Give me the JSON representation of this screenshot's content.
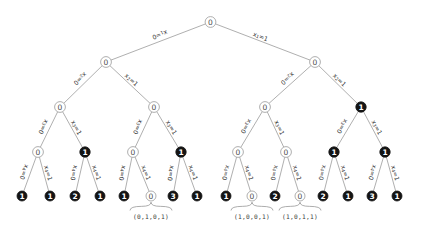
{
  "diagram": {
    "type": "binary-decision-tree",
    "depth": 4,
    "colors": {
      "edge": "#8c8c8c",
      "node_open_fill": "#ffffff",
      "node_open_stroke": "#9a9a9a",
      "node_filled_fill": "#141414",
      "node_open_text": "#4a4a4a",
      "node_filled_text": "#ffffff",
      "label_text": "#2e2e2e",
      "background": "#ffffff"
    },
    "edge_labels": {
      "level1_left": {
        "var": "x",
        "sub": "1",
        "eq": "=0"
      },
      "level1_right": {
        "var": "x",
        "sub": "1",
        "eq": "=1"
      },
      "level2_left": {
        "var": "x",
        "sub": "2",
        "eq": "=0"
      },
      "level2_right": {
        "var": "x",
        "sub": "2",
        "eq": "=1"
      },
      "level3_left": {
        "var": "x",
        "sub": "3",
        "eq": "=0"
      },
      "level3_right": {
        "var": "x",
        "sub": "3",
        "eq": "=1"
      },
      "level4_left": {
        "var": "x",
        "sub": "4",
        "eq": "=0"
      },
      "level4_right": {
        "var": "x",
        "sub": "4",
        "eq": "=1"
      }
    },
    "levels": [
      {
        "level": 0,
        "name": "root",
        "nodes": [
          {
            "id": "n0",
            "label": "0",
            "style": "open",
            "x": 210.5,
            "y": 22
          }
        ]
      },
      {
        "level": 1,
        "name": "level-1",
        "nodes": [
          {
            "id": "n00",
            "label": "0",
            "style": "open",
            "x": 106,
            "y": 62
          },
          {
            "id": "n01",
            "label": "0",
            "style": "open",
            "x": 315,
            "y": 62
          }
        ]
      },
      {
        "level": 2,
        "name": "level-2",
        "nodes": [
          {
            "id": "n000",
            "label": "0",
            "style": "open",
            "x": 60,
            "y": 107
          },
          {
            "id": "n001",
            "label": "0",
            "style": "open",
            "x": 154,
            "y": 107
          },
          {
            "id": "n010",
            "label": "0",
            "style": "open",
            "x": 265,
            "y": 107
          },
          {
            "id": "n011",
            "label": "1",
            "style": "filled",
            "x": 361,
            "y": 107
          }
        ]
      },
      {
        "level": 3,
        "name": "level-3",
        "nodes": [
          {
            "id": "n0000",
            "label": "0",
            "style": "open",
            "x": 38,
            "y": 152
          },
          {
            "id": "n0001",
            "label": "1",
            "style": "filled",
            "x": 85,
            "y": 152
          },
          {
            "id": "n0010",
            "label": "0",
            "style": "open",
            "x": 133,
            "y": 152
          },
          {
            "id": "n0011",
            "label": "1",
            "style": "filled",
            "x": 181,
            "y": 152
          },
          {
            "id": "n0100",
            "label": "0",
            "style": "open",
            "x": 238,
            "y": 152
          },
          {
            "id": "n0101",
            "label": "0",
            "style": "open",
            "x": 286,
            "y": 152
          },
          {
            "id": "n0110",
            "label": "1",
            "style": "filled",
            "x": 334,
            "y": 152
          },
          {
            "id": "n0111",
            "label": "1",
            "style": "filled",
            "x": 385,
            "y": 152
          }
        ]
      },
      {
        "level": 4,
        "name": "leaves",
        "nodes": [
          {
            "id": "l0",
            "label": "1",
            "style": "filled",
            "x": 22,
            "y": 196
          },
          {
            "id": "l1",
            "label": "1",
            "style": "filled",
            "x": 50,
            "y": 196
          },
          {
            "id": "l2",
            "label": "2",
            "style": "filled",
            "x": 75,
            "y": 196
          },
          {
            "id": "l3",
            "label": "1",
            "style": "filled",
            "x": 100,
            "y": 196
          },
          {
            "id": "l4",
            "label": "1",
            "style": "filled",
            "x": 124,
            "y": 196
          },
          {
            "id": "l5",
            "label": "0",
            "style": "open",
            "x": 151,
            "y": 196
          },
          {
            "id": "l6",
            "label": "3",
            "style": "filled",
            "x": 173,
            "y": 196
          },
          {
            "id": "l7",
            "label": "1",
            "style": "filled",
            "x": 197,
            "y": 196
          },
          {
            "id": "l8",
            "label": "1",
            "style": "filled",
            "x": 226,
            "y": 196
          },
          {
            "id": "l9",
            "label": "0",
            "style": "open",
            "x": 252,
            "y": 196
          },
          {
            "id": "l10",
            "label": "2",
            "style": "filled",
            "x": 275,
            "y": 196
          },
          {
            "id": "l11",
            "label": "0",
            "style": "open",
            "x": 300,
            "y": 196
          },
          {
            "id": "l12",
            "label": "2",
            "style": "filled",
            "x": 323,
            "y": 196
          },
          {
            "id": "l13",
            "label": "1",
            "style": "filled",
            "x": 348,
            "y": 196
          },
          {
            "id": "l14",
            "label": "3",
            "style": "filled",
            "x": 372,
            "y": 196
          },
          {
            "id": "l15",
            "label": "1",
            "style": "filled",
            "x": 397,
            "y": 196
          }
        ]
      }
    ],
    "tuple_annotations": [
      {
        "id": "t0",
        "text": "(0,1,0,1)",
        "leaf": "l5",
        "x": 151,
        "y": 216
      },
      {
        "id": "t1",
        "text": "(1,0,0,1)",
        "leaf": "l9",
        "x": 252,
        "y": 216
      },
      {
        "id": "t2",
        "text": "(1,0,1,1)",
        "leaf": "l11",
        "x": 300,
        "y": 216
      }
    ]
  }
}
